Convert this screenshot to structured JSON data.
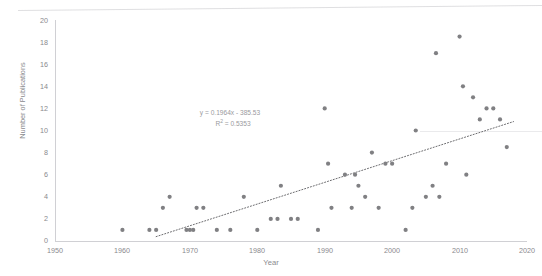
{
  "chart_data": {
    "type": "scatter",
    "title": "",
    "xlabel": "Year",
    "ylabel": "Number of Publications",
    "xlim": [
      1950,
      2020
    ],
    "ylim": [
      0,
      20
    ],
    "xticks": [
      "1950",
      "1960",
      "1970",
      "1980",
      "1990",
      "2000",
      "2010",
      "2020"
    ],
    "yticks": [
      "0",
      "2",
      "4",
      "6",
      "8",
      "10",
      "12",
      "14",
      "16",
      "18",
      "20"
    ],
    "grid": false,
    "legend": "none",
    "marker_color": "#808083",
    "trendline_color": "#6d6d70",
    "axis_color": "#d0d0d4",
    "text_color": "#8a8a8e",
    "annotations": {
      "equation": "y = 0.1964x - 385.53",
      "r_squared_prefix": "R",
      "r_squared_exponent": "2",
      "r_squared_value": " = 0.5353"
    },
    "trendline": {
      "slope": 0.1964,
      "intercept": -385.53,
      "r_squared": 0.5353,
      "x_start": 1965,
      "x_end": 2018
    },
    "x": [
      1960,
      1964,
      1965,
      1966,
      1967,
      1969.5,
      1970,
      1970.5,
      1971,
      1972,
      1974,
      1976,
      1978,
      1980,
      1982,
      1983,
      1983.5,
      1985,
      1986,
      1989,
      1990,
      1990.5,
      1991,
      1993,
      1994,
      1994.5,
      1995,
      1996,
      1997,
      1998,
      1999,
      2000,
      2002,
      2003,
      2003.5,
      2005,
      2006,
      2006.5,
      2007,
      2008,
      2010,
      2010.5,
      2011,
      2012,
      2013,
      2014,
      2015,
      2016,
      2017
    ],
    "y": [
      1,
      1,
      1,
      3,
      4,
      1,
      1,
      1,
      3,
      3,
      1,
      1,
      4,
      1,
      2,
      2,
      5,
      2,
      2,
      1,
      12,
      7,
      3,
      6,
      3,
      6,
      5,
      4,
      8,
      3,
      7,
      7,
      1,
      3,
      10,
      4,
      5,
      17,
      4,
      7,
      18.5,
      14,
      6,
      13,
      11,
      12,
      12,
      11,
      8.5
    ],
    "point_count": 49
  }
}
